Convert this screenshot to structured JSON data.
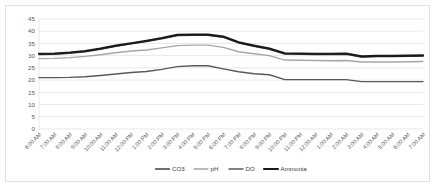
{
  "chart_data": {
    "type": "line",
    "title": "",
    "xlabel": "",
    "ylabel": "",
    "ylim": [
      0,
      45
    ],
    "yticks": [
      "0",
      "5",
      "10",
      "15",
      "20",
      "25",
      "30",
      "35",
      "40",
      "45"
    ],
    "grid": true,
    "legend_position": "bottom",
    "categories": [
      "6:00 AM",
      "7:00 AM",
      "8:00 AM",
      "9:00 AM",
      "10:00 AM",
      "11:00 AM",
      "12:00 PM",
      "1:00 PM",
      "2:00 PM",
      "3:00 PM",
      "4:00 PM",
      "5:00 PM",
      "6:00 PM",
      "7:00 PM",
      "8:00 PM",
      "9:00 PM",
      "10:00 PM",
      "11:00 PM",
      "12:00 AM",
      "1:00 AM",
      "2:00 AM",
      "3:00 AM",
      "4:00 AM",
      "5:00 AM",
      "6:00 AM",
      "7:00 AM"
    ],
    "series": [
      {
        "name": "CO3",
        "color": "#404040",
        "width": 1.4,
        "values": [
          30.5,
          30.6,
          31.0,
          31.6,
          32.6,
          33.8,
          34.8,
          35.8,
          36.9,
          38.2,
          38.3,
          38.3,
          37.5,
          35.2,
          33.8,
          32.6,
          30.7,
          30.6,
          30.5,
          30.5,
          30.6,
          29.4,
          29.6,
          29.6,
          29.7,
          29.8
        ]
      },
      {
        "name": "pH",
        "color": "#a6a6a6",
        "width": 1.4,
        "values": [
          28.8,
          28.9,
          29.2,
          29.7,
          30.4,
          31.2,
          31.9,
          32.3,
          33.2,
          34.1,
          34.3,
          34.3,
          33.4,
          31.6,
          30.8,
          30.0,
          28.2,
          28.1,
          28.0,
          27.9,
          28.0,
          27.4,
          27.4,
          27.4,
          27.5,
          27.6
        ]
      },
      {
        "name": "DO",
        "color": "#595959",
        "width": 1.4,
        "values": [
          21.0,
          21.0,
          21.1,
          21.4,
          21.9,
          22.5,
          23.1,
          23.5,
          24.4,
          25.5,
          25.9,
          25.9,
          24.6,
          23.4,
          22.6,
          22.2,
          20.2,
          20.2,
          20.2,
          20.2,
          20.2,
          19.4,
          19.4,
          19.4,
          19.4,
          19.4
        ]
      },
      {
        "name": "Ammonia",
        "color": "#1a1a1a",
        "width": 2.1,
        "values": [
          30.8,
          30.9,
          31.3,
          31.9,
          32.9,
          34.1,
          35.1,
          36.1,
          37.2,
          38.5,
          38.6,
          38.6,
          37.8,
          35.5,
          34.1,
          32.9,
          31.0,
          30.9,
          30.8,
          30.8,
          30.9,
          29.7,
          29.9,
          29.9,
          30.0,
          30.1
        ]
      }
    ]
  }
}
